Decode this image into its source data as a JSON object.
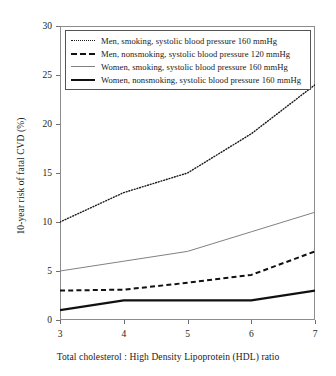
{
  "chart_data": {
    "type": "line",
    "title": "",
    "subtitle": "",
    "xlabel": "Total cholesterol : High Density Lipoprotein (HDL) ratio",
    "ylabel": "10-year risk of fatal CVD (%)",
    "x": [
      3,
      4,
      5,
      6,
      7
    ],
    "xlim": [
      3,
      7
    ],
    "ylim": [
      0,
      30
    ],
    "xticks": [
      3,
      4,
      5,
      6,
      7
    ],
    "yticks": [
      0,
      5,
      10,
      15,
      20,
      25,
      30
    ],
    "xtick_labels": [
      "3",
      "4",
      "5",
      "6",
      "7"
    ],
    "ytick_labels": [
      "0",
      "5",
      "10",
      "15",
      "20",
      "25",
      "30"
    ],
    "grid": false,
    "legend_position": "top-left-inside",
    "series": [
      {
        "name": "Men, smoking, systolic blood pressure 160 mmHg",
        "style": "dotted",
        "color": "#1a1a1a",
        "values": [
          10.0,
          13.0,
          15.0,
          19.0,
          24.0
        ]
      },
      {
        "name": "Men, nonsmoking, systolic blood pressure 120 mmHg",
        "style": "dashed",
        "color": "#111111",
        "values": [
          3.0,
          3.1,
          3.8,
          4.6,
          7.0
        ]
      },
      {
        "name": "Women, smoking, systolic blood pressure 160 mmHg",
        "style": "thin-solid",
        "color": "#808080",
        "values": [
          5.0,
          6.0,
          7.0,
          9.0,
          11.0
        ]
      },
      {
        "name": "Women, nonsmoking, systolic blood pressure 160 mmHg",
        "style": "thick-solid",
        "color": "#111111",
        "values": [
          1.0,
          2.0,
          2.0,
          2.0,
          3.0
        ]
      }
    ]
  },
  "legend": {
    "items": [
      {
        "label": "Men, smoking, systolic blood pressure 160 mmHg",
        "sample": "dotted-line-sample"
      },
      {
        "label": "Men, nonsmoking, systolic blood pressure 120 mmHg",
        "sample": "dashed-line-sample"
      },
      {
        "label": "Women, smoking, systolic blood pressure 160 mmHg",
        "sample": "thin-solid-line-sample"
      },
      {
        "label": "Women, nonsmoking, systolic blood pressure 160 mmHg",
        "sample": "thick-solid-line-sample"
      }
    ]
  }
}
